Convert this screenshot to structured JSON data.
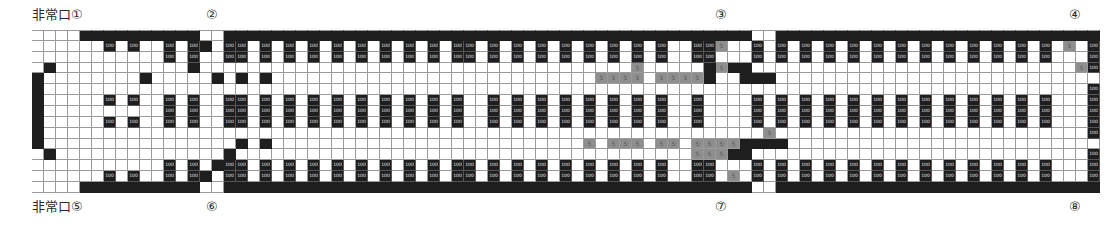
{
  "labels": {
    "exit_1": "非常口①",
    "exit_2": "②",
    "exit_3": "③",
    "exit_4": "④",
    "exit_5": "非常口⑤",
    "exit_6": "⑥",
    "exit_7": "⑦",
    "exit_8": "⑧"
  },
  "legend": {
    "seat_value": "100",
    "gray_value": "5",
    "codes": {
      ".": "empty",
      "#": "wall/blocked",
      "S": "seat (100)",
      "g": "seat (5)"
    }
  },
  "colors": {
    "dark": "#1e1e1e",
    "gray": "#8e8e8e",
    "grid_line": "#9a9a9a",
    "empty": "#ffffff"
  },
  "grid": {
    "columns": 89,
    "rows": [
      "....##########..############################################..###########################..#",
      "......S.S..S.S#.SS.S.S.S.S.S.S.S.S.SS.S.S.S.S.S.S.S.S..SSg..S.S.S.S.S.S.S.S.S.S.S.S.S.g.S",
      "...........S.S..SS.S.S.S.S.S.S.S.S.SS.S.S.S.S.S.S.S.S..SS...S.S.S.S.S.S.S.S.S.S.S.S.S...S",
      ".#...........#....................................g.....#g##...........................gS",
      "#........#.....#.#.#...........................ggg g.gggg#..###...........................S",
      "#.......................................................................................S",
      "#.....S.S..S.S..SS.S.S.S.S.S.S.S.S.S..S.S.S.S.S.S.S.S..S....S.S.S.S.S.S.S.S.S.S.S.S.S...S",
      "#..........S.S..SS.S.S.S.S.S.S.S.S.S..S.S.S.S.S.S.S.S..S....S.S.S.S.S.S.S.S.S.S.S.S.S...S",
      "#.....S.S..S.S..SS.S.S.S.S.S.S.S.S.S..S.S.S.S.S.S.S.S..S....S.S.S.S.S.S.S.S.S.S.S.S.S...S",
      "#............................................................g..........................S",
      "#................#.#..........................g.gg g.gg.gggg####..........................S",
      ".#..............#......................................ggg##............................S",
      "...........S.S.#SS.S.S.S.S.S.S.S.S.SS.S.S.S.S.S.S.S.S..SS...S.S.S.S.S.S.S.S.S.S.S.S.S...S",
      "......S.S..S.S#.SS.S.S.S.S.S.S.S.S.SS.S.S.S.S.S.S.S.S..SS.g.S.S.S.S.S.S.S.S.S.S.S.S.S...S",
      "....##########..############################################..###########################..#"
    ]
  }
}
